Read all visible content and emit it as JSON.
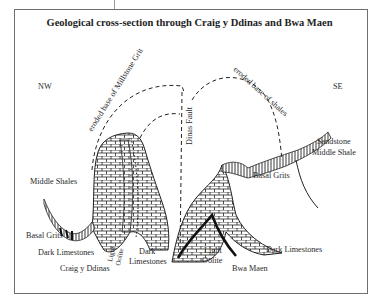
{
  "title": "Geological cross-section through Craig y Ddinas and Bwa Maen",
  "orientation": {
    "left": "NW",
    "right": "SE"
  },
  "curve_labels": {
    "millstone": "eroded base of Millstone Grit",
    "shales": "eroded base of shales",
    "fault": "Dinas Fault"
  },
  "rock_labels": {
    "middle_shales_left": "Middle Shales",
    "basal_grits_left": "Basal Grits",
    "dark_limestones_left": "Dark Limestones",
    "craig_y_ddinas": "Craig y Ddinas",
    "light_oolite_left": "Light",
    "oolite_left": "Oolite",
    "dark_limestones_mid_1": "Dark",
    "dark_limestones_mid_2": "Limestones",
    "basal_grits_right": "Basal Grits",
    "sandstone": "Sandstone",
    "middle_shale_right": "Middle Shale",
    "light_oolite_right_1": "Light",
    "light_oolite_right_2": "Oolite",
    "bwa_maen": "Bwa Maen",
    "dark_limestones_right": "Dark Limestones"
  },
  "colors": {
    "ink": "#1e1e1e",
    "frame": "#6f6f6f"
  }
}
